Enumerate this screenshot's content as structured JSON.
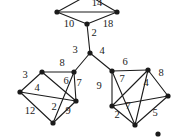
{
  "figure": {
    "background": "#ffffff",
    "ink": "#1b1b1b",
    "node_radius": 2.6,
    "edge_width": 1.1,
    "label_font_size": 10.5,
    "nodes": [
      {
        "id": "top-apex",
        "x": 88,
        "y": -5
      },
      {
        "id": "top-left",
        "x": 57,
        "y": 12
      },
      {
        "id": "top-right",
        "x": 117,
        "y": 12
      },
      {
        "id": "top-bottom",
        "x": 87,
        "y": 24
      },
      {
        "id": "hub",
        "x": 90,
        "y": 53
      },
      {
        "id": "left-a",
        "x": 42,
        "y": 72
      },
      {
        "id": "left-b",
        "x": 20,
        "y": 92
      },
      {
        "id": "left-c",
        "x": 74,
        "y": 72
      },
      {
        "id": "left-d",
        "x": 76,
        "y": 101
      },
      {
        "id": "left-e",
        "x": 53,
        "y": 123
      },
      {
        "id": "right-f",
        "x": 112,
        "y": 71
      },
      {
        "id": "right-g",
        "x": 148,
        "y": 70
      },
      {
        "id": "right-h",
        "x": 112,
        "y": 106
      },
      {
        "id": "right-i",
        "x": 168,
        "y": 96
      },
      {
        "id": "right-j",
        "x": 135,
        "y": 125
      }
    ],
    "edges": [
      {
        "from": "top-apex",
        "to": "top-left",
        "label": "",
        "lx": 0,
        "ly": 0
      },
      {
        "from": "top-apex",
        "to": "top-right",
        "label": "",
        "lx": 0,
        "ly": 0
      },
      {
        "from": "top-left",
        "to": "top-right",
        "label": "14",
        "lx": 97,
        "ly": 4
      },
      {
        "from": "top-left",
        "to": "top-bottom",
        "label": "10",
        "lx": 69,
        "ly": 25
      },
      {
        "from": "top-right",
        "to": "top-bottom",
        "label": "18",
        "lx": 108,
        "ly": 25
      },
      {
        "from": "top-bottom",
        "to": "hub",
        "label": "2",
        "lx": 94,
        "ly": 34
      },
      {
        "from": "hub",
        "to": "left-c",
        "label": "3",
        "lx": 75,
        "ly": 51
      },
      {
        "from": "hub",
        "to": "right-f",
        "label": "4",
        "lx": 102,
        "ly": 52
      },
      {
        "from": "left-a",
        "to": "left-b",
        "label": "3",
        "lx": 25,
        "ly": 76
      },
      {
        "from": "left-a",
        "to": "left-c",
        "label": "8",
        "lx": 62,
        "ly": 64
      },
      {
        "from": "left-a",
        "to": "left-d",
        "label": "6",
        "lx": 66,
        "ly": 82
      },
      {
        "from": "left-b",
        "to": "left-d",
        "label": "4",
        "lx": 37,
        "ly": 89
      },
      {
        "from": "left-b",
        "to": "left-e",
        "label": "12",
        "lx": 30,
        "ly": 112
      },
      {
        "from": "left-c",
        "to": "left-d",
        "label": "7",
        "lx": 79,
        "ly": 84
      },
      {
        "from": "left-c",
        "to": "left-e",
        "label": "2",
        "lx": 54,
        "ly": 108
      },
      {
        "from": "left-d",
        "to": "left-e",
        "label": "9",
        "lx": 68,
        "ly": 112
      },
      {
        "from": "right-f",
        "to": "right-g",
        "label": "6",
        "lx": 125,
        "ly": 63
      },
      {
        "from": "right-f",
        "to": "right-h",
        "label": "9",
        "lx": 99,
        "ly": 87
      },
      {
        "from": "right-f",
        "to": "right-j",
        "label": "7",
        "lx": 128,
        "ly": 107
      },
      {
        "from": "right-g",
        "to": "right-h",
        "label": "7",
        "lx": 122,
        "ly": 80
      },
      {
        "from": "right-g",
        "to": "right-i",
        "label": "8",
        "lx": 161,
        "ly": 74
      },
      {
        "from": "right-g",
        "to": "right-j",
        "label": "4",
        "lx": 146,
        "ly": 84
      },
      {
        "from": "right-h",
        "to": "right-i",
        "label": "",
        "lx": 0,
        "ly": 0
      },
      {
        "from": "right-h",
        "to": "right-j",
        "label": "2",
        "lx": 117,
        "ly": 116
      },
      {
        "from": "right-i",
        "to": "right-j",
        "label": "5",
        "lx": 155,
        "ly": 114
      }
    ],
    "stray_dots": [
      {
        "x": 158,
        "y": 134
      }
    ]
  }
}
